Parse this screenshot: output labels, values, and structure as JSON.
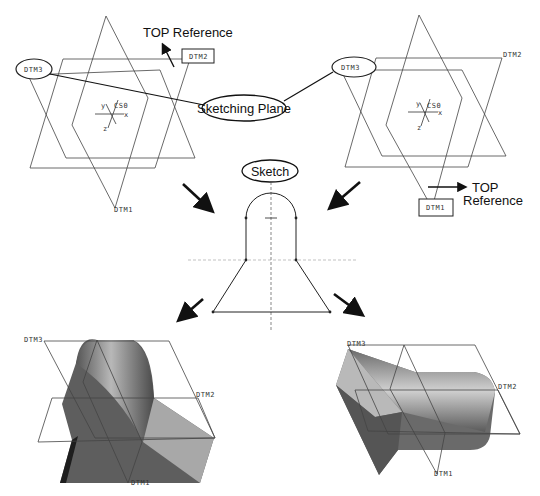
{
  "diagram": {
    "callouts": {
      "top_reference_left": "TOP  Reference",
      "sketching_plane": "Sketching Plane",
      "sketch": "Sketch",
      "top_reference_right_line1": "TOP",
      "top_reference_right_line2": "Reference"
    },
    "datum_labels": {
      "dtm1": "DTM1",
      "dtm2": "DTM2",
      "dtm3": "DTM3",
      "csys": "CS0",
      "axis_x": "x",
      "axis_y": "y",
      "axis_z": "z"
    },
    "panels": [
      {
        "id": "top-left",
        "description": "Datum planes with DTM2 boxed as TOP reference"
      },
      {
        "id": "top-right",
        "description": "Datum planes with DTM1 boxed as TOP reference"
      },
      {
        "id": "center",
        "description": "2D sketch profile: arc top, vertical sides, trapezoid base"
      },
      {
        "id": "bottom-left",
        "description": "Extruded solid oriented with DTM2 as top"
      },
      {
        "id": "bottom-right",
        "description": "Extruded solid oriented with DTM1 as top"
      }
    ],
    "colors": {
      "line": "#444444",
      "solid_dark": "#4a4a4a",
      "solid_mid": "#7a7a7a",
      "solid_light": "#b5b5b5"
    }
  }
}
